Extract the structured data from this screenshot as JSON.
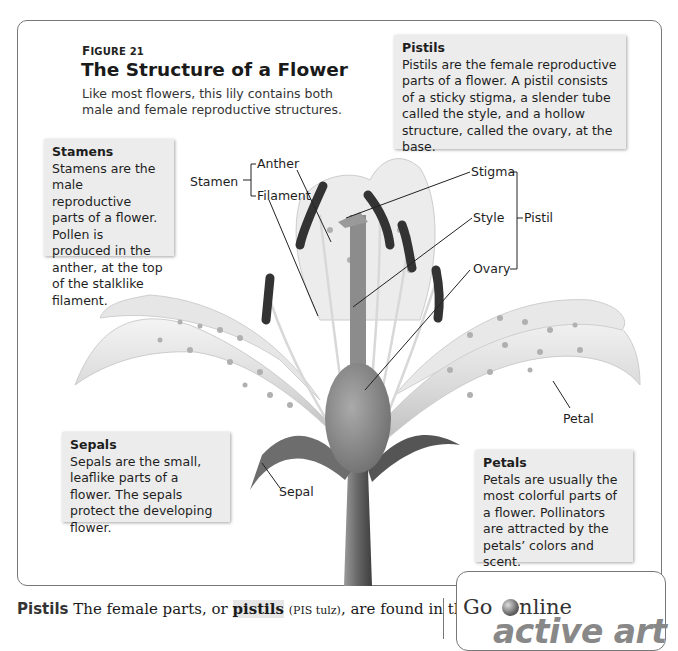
{
  "figure": {
    "number_prefix": "F",
    "number_rest": "IGURE 21",
    "title": "The Structure of a Flower",
    "caption": "Like most flowers, this lily contains both male and female reproductive structures."
  },
  "notes": {
    "pistils": {
      "title": "Pistils",
      "text": "Pistils are the female reproductive parts of a flower. A pistil consists of a sticky stigma, a slender tube called the style, and a hollow structure, called the ovary, at the base."
    },
    "stamens": {
      "title": "Stamens",
      "text": "Stamens are the male reproductive parts of a flower. Pollen is produced in the anther, at the top of the stalklike filament."
    },
    "sepals": {
      "title": "Sepals",
      "text": "Sepals are the small, leaflike parts of a flower. The sepals protect the developing flower."
    },
    "petals": {
      "title": "Petals",
      "text": "Petals are usually the most colorful parts of a flower. Pollinators are attracted by the petals’ colors and scent."
    }
  },
  "labels": {
    "stamen": "Stamen",
    "anther": "Anther",
    "filament": "Filament",
    "stigma": "Stigma",
    "style": "Style",
    "ovary": "Ovary",
    "pistil": "Pistil",
    "petal": "Petal",
    "sepal": "Sepal"
  },
  "body": {
    "heading": "Pistils",
    "text_before": " The female parts, or ",
    "term": "pistils",
    "pronunciation": "(PIS tulz)",
    "text_after": ", are found in the"
  },
  "go_online": {
    "go": "Go",
    "nline": "nline",
    "brand": "active art"
  },
  "colors": {
    "note_bg": "#ececec",
    "frame_border": "#777777",
    "anther": "#3a3a3a"
  }
}
